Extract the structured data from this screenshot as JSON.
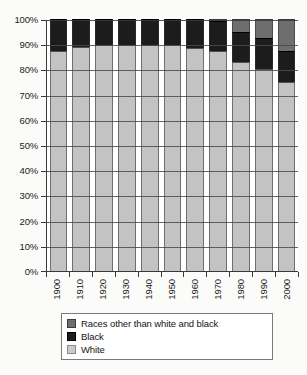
{
  "chart_data": {
    "type": "bar",
    "subtype": "stacked-percentage-column",
    "title": "",
    "xlabel": "",
    "ylabel": "",
    "ylim": [
      0,
      100
    ],
    "ytick_labels": [
      "0%",
      "10%",
      "20%",
      "30%",
      "40%",
      "50%",
      "60%",
      "70%",
      "80%",
      "90%",
      "100%"
    ],
    "ytick_values": [
      0,
      10,
      20,
      30,
      40,
      50,
      60,
      70,
      80,
      90,
      100
    ],
    "grid": true,
    "grid_axis": "y",
    "legend_position": "bottom",
    "categories": [
      "1900",
      "1910",
      "1920",
      "1930",
      "1940",
      "1950",
      "1960",
      "1970",
      "1980",
      "1990",
      "2000"
    ],
    "series": [
      {
        "name": "White",
        "color": "#c3c3c3",
        "values": [
          87.5,
          88.9,
          89.7,
          89.8,
          89.8,
          89.5,
          88.6,
          87.5,
          83.1,
          80.3,
          75.1
        ]
      },
      {
        "name": "Black",
        "color": "#1c1c1c",
        "values": [
          12.5,
          11.1,
          10.3,
          10.2,
          10.2,
          10.5,
          11.4,
          11.7,
          11.7,
          12.1,
          12.3
        ]
      },
      {
        "name": "Races other than white and black",
        "color": "#6e6e6e",
        "values": [
          0.0,
          0.0,
          0.0,
          0.0,
          0.0,
          0.0,
          0.0,
          0.8,
          5.2,
          7.6,
          12.6
        ]
      }
    ],
    "stack_order_bottom_to_top": [
      "White",
      "Black",
      "Races other than white and black"
    ]
  },
  "legend": {
    "items": [
      {
        "label": "Races other than white and black",
        "swatch": "dark-gray"
      },
      {
        "label": "Black",
        "swatch": "black"
      },
      {
        "label": "White",
        "swatch": "light-gray"
      }
    ]
  },
  "colors": {
    "white_series": "#c3c3c3",
    "black_series": "#1c1c1c",
    "other_series": "#6e6e6e",
    "axis": "#3a3a3a",
    "background": "#fbfbf9"
  }
}
